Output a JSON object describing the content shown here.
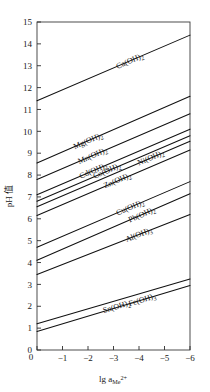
{
  "chart_data": {
    "type": "line",
    "title": "",
    "xlabel": "lg a",
    "xlabel_sub": "Me",
    "xlabel_sup": "2+",
    "ylabel": "pH 值",
    "xlim": [
      0,
      -6
    ],
    "ylim": [
      0,
      15
    ],
    "grid": false,
    "legend": "inline-labels",
    "xticks": [
      0,
      -1,
      -2,
      -3,
      -4,
      -5,
      -6
    ],
    "xticklabels": [
      "0",
      "−1",
      "−2",
      "−3",
      "−4",
      "−5",
      "−6"
    ],
    "yticks": [
      0,
      1,
      2,
      3,
      4,
      5,
      6,
      7,
      8,
      9,
      10,
      11,
      12,
      13,
      14,
      15
    ],
    "yticklabels": [
      "0",
      "1",
      "2",
      "3",
      "4",
      "5",
      "6",
      "7",
      "8",
      "9",
      "10",
      "11",
      "12",
      "13",
      "14",
      "15"
    ],
    "x": [
      0,
      -6
    ],
    "series": [
      {
        "name": "Ca(OH)2",
        "label": "Ca(OH)",
        "label_sub": "2",
        "values": [
          11.4,
          14.4
        ]
      },
      {
        "name": "Mg(OH)2",
        "label": "Mg(OH)",
        "label_sub": "2",
        "values": [
          8.55,
          11.6
        ]
      },
      {
        "name": "Mn(OH)2",
        "label": "Mn(OH)",
        "label_sub": "2",
        "values": [
          7.8,
          10.8
        ]
      },
      {
        "name": "Cd(OH)2",
        "label": "Cd(OH)",
        "label_sub": "2",
        "values": [
          7.1,
          10.1
        ]
      },
      {
        "name": "Co(OH)2",
        "label": "Co(OH)",
        "label_sub": "2",
        "values": [
          6.8,
          9.8
        ]
      },
      {
        "name": "Ni(OH)2",
        "label": "Ni(OH)",
        "label_sub": "2",
        "values": [
          6.55,
          9.55
        ]
      },
      {
        "name": "Zn(OH)2",
        "label": "Zn(OH)",
        "label_sub": "2",
        "values": [
          6.15,
          9.15
        ]
      },
      {
        "name": "Cu(OH)2",
        "label": "Cu(OH)",
        "label_sub": "2",
        "values": [
          4.7,
          7.7
        ]
      },
      {
        "name": "Pb(OH)2",
        "label": "Pb(OH)",
        "label_sub": "2",
        "values": [
          4.1,
          7.15
        ]
      },
      {
        "name": "Al(OH)3",
        "label": "Al(OH)",
        "label_sub": "3",
        "values": [
          3.45,
          6.2
        ]
      },
      {
        "name": "Sn(OH)2",
        "label": "Sn(OH)",
        "label_sub": "2",
        "values": [
          1.2,
          3.25
        ]
      },
      {
        "name": "Fe(OH)3",
        "label": "Fe(OH)",
        "label_sub": "3",
        "values": [
          0.85,
          2.95
        ]
      }
    ]
  }
}
